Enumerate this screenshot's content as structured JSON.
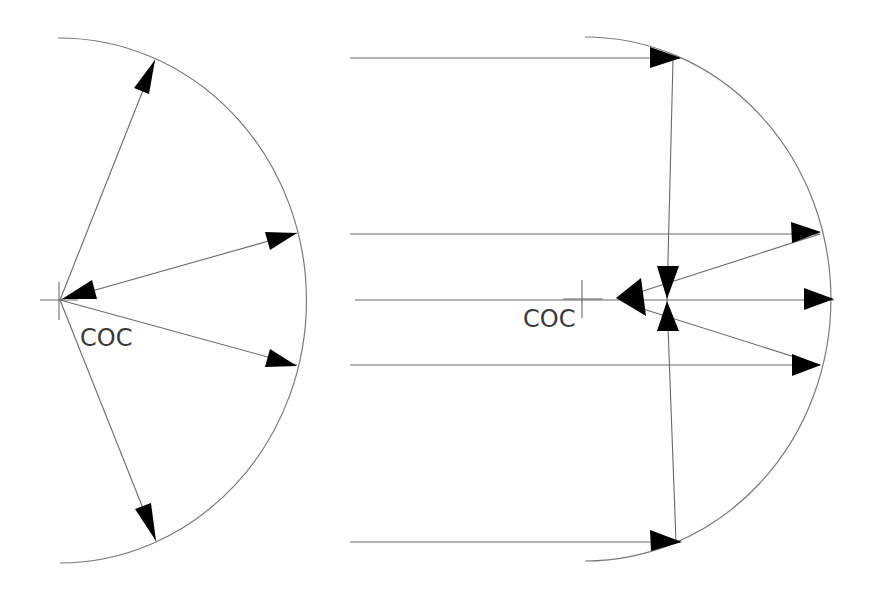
{
  "diagram": {
    "type": "optics-ray-diagram",
    "colors": {
      "line": "#6a6a6a",
      "arc": "#7a7a7a",
      "arrowhead": "#000000",
      "label": "#3a3a3a",
      "background": "#ffffff"
    },
    "left_panel": {
      "label": "COC",
      "description": "Rays radiating from the center of curvature to a concave mirror and reflecting back",
      "center_of_curvature": {
        "x": 60,
        "y": 300
      },
      "mirror_arc": {
        "top": {
          "x": 58,
          "y": 38
        },
        "bottom": {
          "x": 60,
          "y": 563
        },
        "apex_x": 305
      },
      "rays": [
        {
          "from": [
            60,
            300
          ],
          "to": [
            155,
            60
          ],
          "arrow_at": "end"
        },
        {
          "from": [
            60,
            300
          ],
          "to": [
            297,
            233
          ],
          "arrow_at": "end"
        },
        {
          "from": [
            297,
            233
          ],
          "to": [
            60,
            300
          ],
          "arrow_at": "end",
          "note": "reflected ray returning to COC"
        },
        {
          "from": [
            60,
            300
          ],
          "to": [
            297,
            365
          ],
          "arrow_at": "end"
        },
        {
          "from": [
            60,
            300
          ],
          "to": [
            156,
            541
          ],
          "arrow_at": "end"
        }
      ]
    },
    "right_panel": {
      "label": "COC",
      "description": "Parallel rays incident on a spherical surface with converging/diverging rays near the axis",
      "center_of_curvature": {
        "x": 582,
        "y": 300
      },
      "mirror_arc": {
        "top": {
          "x": 585,
          "y": 37
        },
        "bottom": {
          "x": 585,
          "y": 561
        },
        "apex_x": 831
      },
      "parallel_rays_y": [
        58,
        234,
        300,
        365,
        542
      ],
      "parallel_rays_start_x": 350
    }
  }
}
